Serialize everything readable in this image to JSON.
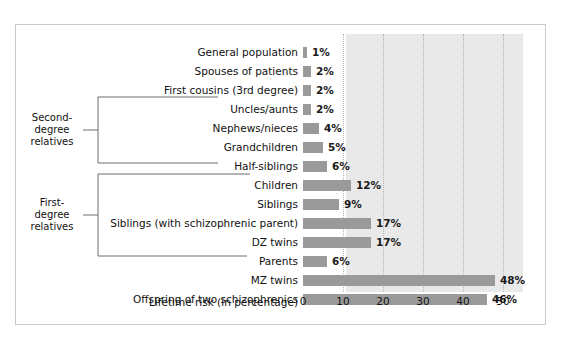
{
  "chart_data": {
    "type": "bar",
    "orientation": "horizontal",
    "title": "",
    "xlabel": "Lifetime risk (in percentage)",
    "ylabel": "",
    "xlim": [
      0,
      55
    ],
    "xticks": [
      0,
      10,
      20,
      30,
      40,
      50
    ],
    "xtick_labels": [
      "0",
      "10",
      "20",
      "30",
      "40",
      "50"
    ],
    "grid": true,
    "grid_style": "dotted vertical",
    "legend": "none",
    "categories": [
      "General population",
      "Spouses of patients",
      "First cousins (3rd degree)",
      "Uncles/aunts",
      "Nephews/nieces",
      "Grandchildren",
      "Half-siblings",
      "Children",
      "Siblings",
      "Siblings (with schizophrenic parent)",
      "DZ twins",
      "Parents",
      "MZ twins",
      "Offspring of two schizophrenics"
    ],
    "values": [
      1,
      2,
      2,
      2,
      4,
      5,
      6,
      12,
      9,
      17,
      17,
      6,
      48,
      46
    ],
    "value_labels": [
      "1%",
      "2%",
      "2%",
      "2%",
      "4%",
      "5%",
      "6%",
      "12%",
      "9%",
      "17%",
      "17%",
      "6%",
      "48%",
      "46%"
    ],
    "annotations": [
      {
        "label_lines": [
          "Second-",
          "degree",
          "relatives"
        ],
        "covers_categories": [
          "Uncles/aunts",
          "Nephews/nieces",
          "Grandchildren",
          "Half-siblings"
        ]
      },
      {
        "label_lines": [
          "First-",
          "degree",
          "relatives"
        ],
        "covers_categories": [
          "Children",
          "Siblings",
          "Siblings (with schizophrenic parent)",
          "DZ twins",
          "Parents"
        ]
      }
    ],
    "colors": {
      "bar": "#9a9a9a",
      "plot_background": "#e9e9e9",
      "gridline": "#b4b4b4",
      "frame": "#c9c9c9",
      "text": "#111111"
    }
  }
}
